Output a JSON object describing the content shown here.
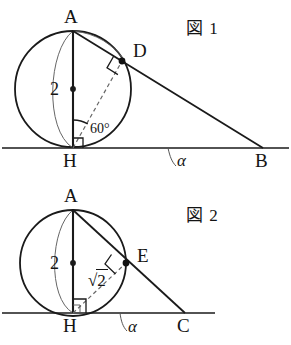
{
  "figures": [
    {
      "tag": "図 1",
      "tag_pos": {
        "x": 186,
        "y": 14
      },
      "baseline_y": 148,
      "circle": {
        "cx": 73,
        "cy": 89,
        "r": 58
      },
      "points": {
        "A": {
          "x": 73,
          "y": 31,
          "label": "A",
          "label_pos": {
            "x": 64,
            "y": 7
          }
        },
        "H": {
          "x": 73,
          "y": 148,
          "label": "H",
          "label_pos": {
            "x": 63,
            "y": 151
          }
        },
        "D": {
          "x": 122,
          "y": 61,
          "label": "D",
          "label_pos": {
            "x": 133,
            "y": 41
          }
        },
        "B": {
          "x": 263,
          "y": 148,
          "label": "B",
          "label_pos": {
            "x": 255,
            "y": 151
          }
        },
        "center": {
          "x": 73,
          "y": 89
        }
      },
      "diameter_label": {
        "text": "2",
        "x": 50,
        "y": 80
      },
      "angle_label": {
        "text": "60°",
        "x": 90,
        "y": 122
      },
      "alpha_label": {
        "text": "α",
        "x": 177,
        "y": 152
      },
      "right_angle_at": [
        "D",
        "H"
      ],
      "dashed_segment": "H-D",
      "solid_segments": [
        "A-H",
        "A-B",
        "H-B"
      ],
      "tangent_point": "D"
    },
    {
      "tag": "図 2",
      "tag_pos": {
        "x": 186,
        "y": 201
      },
      "baseline_y": 313,
      "circle": {
        "cx": 73,
        "cy": 263,
        "r": 53
      },
      "points": {
        "A": {
          "x": 73,
          "y": 210,
          "label": "A",
          "label_pos": {
            "x": 64,
            "y": 186
          }
        },
        "H": {
          "x": 73,
          "y": 313,
          "label": "H",
          "label_pos": {
            "x": 63,
            "y": 316
          }
        },
        "E": {
          "x": 126,
          "y": 263,
          "label": "E",
          "label_pos": {
            "x": 137,
            "y": 246
          }
        },
        "C": {
          "x": 185,
          "y": 313,
          "label": "C",
          "label_pos": {
            "x": 177,
            "y": 316
          }
        },
        "center": {
          "x": 73,
          "y": 263
        }
      },
      "diameter_label": {
        "text": "2",
        "x": 50,
        "y": 254
      },
      "sqrt_label": {
        "prefix": "√",
        "radicand": "2",
        "x": 88,
        "y": 271
      },
      "alpha_label": {
        "text": "α",
        "x": 128,
        "y": 318
      },
      "right_angle_at": [
        "E",
        "H"
      ],
      "dashed_segment": "H-E",
      "solid_segments": [
        "A-H",
        "A-C",
        "H-C"
      ],
      "tangent_point": "E"
    }
  ],
  "colors": {
    "stroke": "#1a1a1a",
    "thin_stroke": "#555555",
    "dashed": "#666666",
    "background": "#ffffff"
  }
}
